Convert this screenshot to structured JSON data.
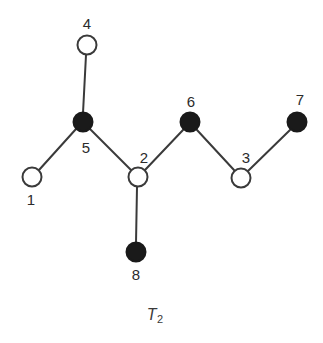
{
  "figure": {
    "caption_symbol": "T",
    "caption_subscript": "2",
    "width": 323,
    "height": 343,
    "background_color": "#ffffff"
  },
  "graph": {
    "type": "tree-diagram",
    "edge_color": "#3a3a3a",
    "edge_width": 2,
    "node_stroke_color": "#3a3a3a",
    "node_fill_open": "#ffffff",
    "node_fill_filled": "#1a1a1a",
    "label_color": "#2b2b2b",
    "nodes": [
      {
        "id": "1",
        "label": "1",
        "fill": "open",
        "cx": 32,
        "cy": 177,
        "r": 9.5,
        "label_x": 31,
        "label_y": 199
      },
      {
        "id": "2",
        "label": "2",
        "fill": "open",
        "cx": 138,
        "cy": 177,
        "r": 9.5,
        "label_x": 144,
        "label_y": 157
      },
      {
        "id": "3",
        "label": "3",
        "fill": "open",
        "cx": 241,
        "cy": 178,
        "r": 9.5,
        "label_x": 246,
        "label_y": 157
      },
      {
        "id": "4",
        "label": "4",
        "fill": "open",
        "cx": 87,
        "cy": 45,
        "r": 9.5,
        "label_x": 87,
        "label_y": 23
      },
      {
        "id": "5",
        "label": "5",
        "fill": "filled",
        "cx": 83,
        "cy": 122,
        "r": 9.5,
        "label_x": 86,
        "label_y": 147
      },
      {
        "id": "6",
        "label": "6",
        "fill": "filled",
        "cx": 190,
        "cy": 122,
        "r": 9.5,
        "label_x": 191,
        "label_y": 101
      },
      {
        "id": "7",
        "label": "7",
        "fill": "filled",
        "cx": 297,
        "cy": 122,
        "r": 9.5,
        "label_x": 300,
        "label_y": 99
      },
      {
        "id": "8",
        "label": "8",
        "fill": "filled",
        "cx": 136,
        "cy": 252,
        "r": 9.5,
        "label_x": 136,
        "label_y": 274
      }
    ],
    "edges": [
      {
        "from": "4",
        "to": "5",
        "x1": 86,
        "y1": 55,
        "x2": 83,
        "y2": 113
      },
      {
        "from": "5",
        "to": "1",
        "x1": 76,
        "y1": 129,
        "x2": 39,
        "y2": 170
      },
      {
        "from": "5",
        "to": "2",
        "x1": 90,
        "y1": 129,
        "x2": 131,
        "y2": 170
      },
      {
        "from": "2",
        "to": "8",
        "x1": 137,
        "y1": 187,
        "x2": 136,
        "y2": 243
      },
      {
        "from": "2",
        "to": "6",
        "x1": 145,
        "y1": 170,
        "x2": 183,
        "y2": 130
      },
      {
        "from": "6",
        "to": "3",
        "x1": 197,
        "y1": 130,
        "x2": 234,
        "y2": 170
      },
      {
        "from": "3",
        "to": "7",
        "x1": 248,
        "y1": 171,
        "x2": 290,
        "y2": 130
      }
    ]
  }
}
